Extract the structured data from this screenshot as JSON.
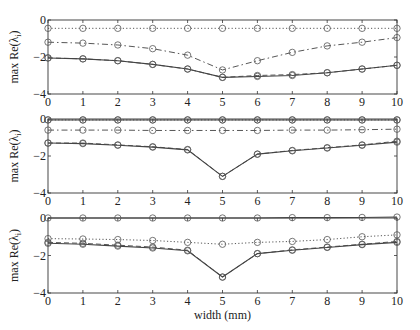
{
  "chart_data": [
    {
      "type": "line",
      "panel": "top",
      "xlabel": "",
      "ylabel": "max Re(λ_i)",
      "xlim": [
        0,
        10
      ],
      "ylim": [
        -4,
        0
      ],
      "xticks": [
        0,
        1,
        2,
        3,
        4,
        5,
        6,
        7,
        8,
        9,
        10
      ],
      "yticks": [
        0,
        -2,
        -4
      ],
      "x": [
        0,
        1,
        2,
        3,
        4,
        5,
        6,
        7,
        8,
        9,
        10
      ],
      "series": [
        {
          "name": "dotted",
          "style": "dotted",
          "values": [
            -0.45,
            -0.45,
            -0.45,
            -0.45,
            -0.45,
            -0.45,
            -0.45,
            -0.45,
            -0.45,
            -0.45,
            -0.45
          ]
        },
        {
          "name": "dash-dot",
          "style": "dashdot",
          "values": [
            -1.2,
            -1.25,
            -1.35,
            -1.55,
            -1.9,
            -2.7,
            -2.2,
            -1.75,
            -1.4,
            -1.2,
            -0.95
          ]
        },
        {
          "name": "dashed",
          "style": "dashed",
          "values": [
            -2.05,
            -2.1,
            -2.2,
            -2.4,
            -2.65,
            -3.1,
            -3.0,
            -2.95,
            -2.85,
            -2.65,
            -2.45
          ]
        },
        {
          "name": "solid",
          "style": "solid",
          "values": [
            -2.05,
            -2.1,
            -2.2,
            -2.4,
            -2.65,
            -3.1,
            -3.05,
            -3.0,
            -2.85,
            -2.65,
            -2.45
          ]
        }
      ]
    },
    {
      "type": "line",
      "panel": "middle",
      "xlabel": "",
      "ylabel": "max Re(λ_i)",
      "xlim": [
        0,
        10
      ],
      "ylim": [
        -4,
        0
      ],
      "xticks": [
        0,
        1,
        2,
        3,
        4,
        5,
        6,
        7,
        8,
        9,
        10
      ],
      "yticks": [
        0,
        -2,
        -4
      ],
      "x": [
        0,
        1,
        2,
        3,
        4,
        5,
        6,
        7,
        8,
        9,
        10
      ],
      "series": [
        {
          "name": "solid-top",
          "style": "solid",
          "values": [
            -0.05,
            -0.05,
            -0.05,
            -0.05,
            -0.05,
            -0.05,
            -0.05,
            -0.05,
            -0.05,
            -0.05,
            -0.05
          ]
        },
        {
          "name": "dotted",
          "style": "dotted",
          "values": [
            -0.05,
            -0.05,
            -0.05,
            -0.05,
            -0.05,
            -0.05,
            -0.05,
            -0.05,
            -0.05,
            -0.05,
            -0.05
          ]
        },
        {
          "name": "dash-dot",
          "style": "dashdot",
          "values": [
            -0.6,
            -0.6,
            -0.6,
            -0.62,
            -0.62,
            -0.62,
            -0.62,
            -0.6,
            -0.6,
            -0.58,
            -0.55
          ]
        },
        {
          "name": "dashed",
          "style": "dashed",
          "values": [
            -1.3,
            -1.3,
            -1.4,
            -1.5,
            -1.65,
            -3.1,
            -1.9,
            -1.7,
            -1.55,
            -1.4,
            -1.2
          ]
        },
        {
          "name": "solid",
          "style": "solid",
          "values": [
            -1.3,
            -1.33,
            -1.42,
            -1.52,
            -1.67,
            -3.1,
            -1.9,
            -1.72,
            -1.57,
            -1.42,
            -1.25
          ]
        }
      ]
    },
    {
      "type": "line",
      "panel": "bottom",
      "xlabel": "width (mm)",
      "ylabel": "max Re(λ_i)",
      "xlim": [
        0,
        10
      ],
      "ylim": [
        -4,
        0
      ],
      "xticks": [
        0,
        1,
        2,
        3,
        4,
        5,
        6,
        7,
        8,
        9,
        10
      ],
      "yticks": [
        0,
        -2,
        -4
      ],
      "x": [
        0,
        1,
        2,
        3,
        4,
        5,
        6,
        7,
        8,
        9,
        10
      ],
      "series": [
        {
          "name": "solid-top",
          "style": "solid",
          "values": [
            0,
            0,
            0,
            0,
            0,
            0,
            0,
            0.02,
            0.02,
            0.03,
            0.05
          ]
        },
        {
          "name": "dotted",
          "style": "dotted",
          "values": [
            -1.1,
            -1.12,
            -1.15,
            -1.2,
            -1.3,
            -1.4,
            -1.3,
            -1.25,
            -1.15,
            -1.0,
            -0.9
          ]
        },
        {
          "name": "dashed",
          "style": "dashed",
          "values": [
            -1.3,
            -1.35,
            -1.45,
            -1.55,
            -1.72,
            -3.15,
            -1.9,
            -1.7,
            -1.55,
            -1.4,
            -1.25
          ]
        },
        {
          "name": "solid",
          "style": "solid",
          "values": [
            -1.35,
            -1.4,
            -1.5,
            -1.6,
            -1.75,
            -3.15,
            -1.9,
            -1.72,
            -1.57,
            -1.42,
            -1.3
          ]
        }
      ]
    }
  ],
  "layout": {
    "panels": [
      {
        "left": 48,
        "right": 397,
        "top": 20,
        "bottom": 94
      },
      {
        "left": 48,
        "right": 397,
        "top": 119,
        "bottom": 193
      },
      {
        "left": 48,
        "right": 397,
        "top": 218,
        "bottom": 293
      }
    ],
    "line_color": "#444444",
    "marker_color": "#555555"
  },
  "labels": {
    "ylabel_main": "max Re(λ",
    "ylabel_sub": "i",
    "ylabel_close": ")",
    "xlabel": "width (mm)"
  }
}
